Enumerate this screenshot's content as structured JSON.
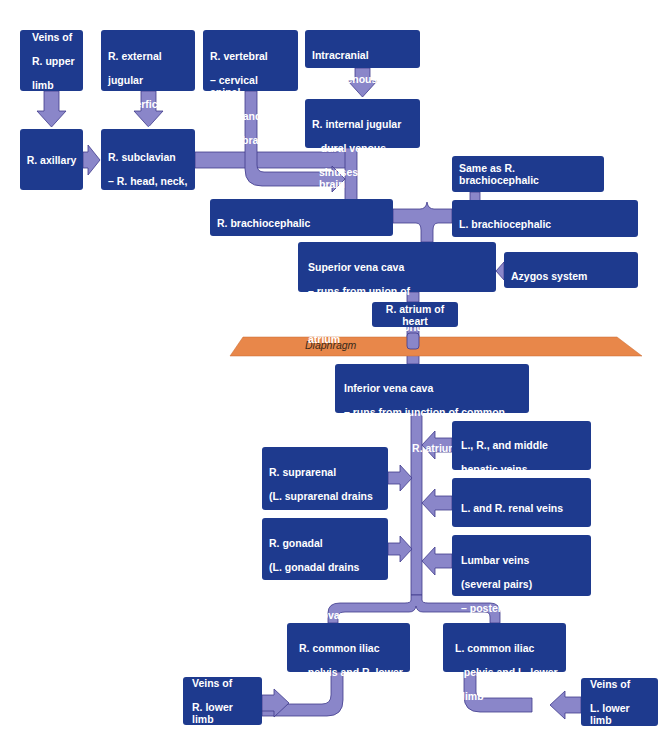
{
  "diagram": {
    "type": "flowchart",
    "colors": {
      "box_fill": "#1e3a8e",
      "box_text": "#ffffff",
      "connector_fill": "#8a86c9",
      "connector_stroke": "#3f3a8c",
      "diaphragm_fill": "#e8874a",
      "background": "#ffffff"
    },
    "nodes": {
      "veins_r_upper_limb": {
        "lines": [
          "Veins of",
          "R. upper",
          "limb"
        ]
      },
      "r_external_jugular": {
        "lines": [
          "R. external",
          "jugular"
        ],
        "sub": [
          "– superficial",
          "head and neck"
        ]
      },
      "r_vertebral": {
        "lines": [
          "R. vertebral"
        ],
        "sub": [
          "– cervical spinal",
          "cord and",
          "vertebrae"
        ]
      },
      "intracranial": {
        "lines": [
          "Intracranial",
          "dural venous sinuses"
        ]
      },
      "r_internal_jugular": {
        "lines": [
          "R. internal jugular"
        ],
        "sub": [
          "– dural venous",
          "sinuses of the brain"
        ]
      },
      "r_axillary": {
        "lines": [
          "R. axillary"
        ]
      },
      "r_subclavian": {
        "lines": [
          "R. subclavian"
        ],
        "sub": [
          "– R. head, neck,",
          "and upper",
          "limb"
        ]
      },
      "same_as_r_brachio": {
        "lines": [
          "Same as R. brachiocephalic"
        ]
      },
      "r_brachiocephalic": {
        "lines": [
          "R. brachiocephalic",
          "– R. side of head and R. upper limb"
        ]
      },
      "l_brachiocephalic": {
        "lines": [
          "L. brachiocephalic",
          "– L. side of head and L. upper limb"
        ]
      },
      "superior_vena_cava": {
        "lines": [
          "Superior vena cava",
          "– runs from union of brachiocephalic",
          "veins behind manubrium to R. atrium"
        ]
      },
      "azygos": {
        "lines": [
          "Azygos system",
          "– drains much of thorax"
        ]
      },
      "r_atrium": {
        "lines": [
          "R. atrium of heart"
        ]
      },
      "diaphragm": {
        "label": "Diaphragm"
      },
      "inferior_vena_cava": {
        "line1": "Inferior vena cava",
        "line2": "– runs from junction of common iliac",
        "line3_pre": "veins at L",
        "line3_sub": "5",
        "line3_post": " to R. atrium of heart"
      },
      "hepatic": {
        "lines": [
          "L., R., and middle",
          "hepatic veins",
          "– liver"
        ]
      },
      "r_suprarenal": {
        "lines": [
          "R. suprarenal",
          "(L. suprarenal drains",
          "into L. renal vein)",
          "– adrenal glands"
        ]
      },
      "renal": {
        "lines": [
          "L. and R. renal veins",
          "– kidneys"
        ]
      },
      "r_gonadal": {
        "lines": [
          "R. gonadal",
          "(L. gonadal drains",
          "into L. renal vein)",
          "– testis or ovary"
        ]
      },
      "lumbar": {
        "lines": [
          "Lumbar veins",
          "(several pairs)",
          "– posterior abdominal"
        ],
        "sub": [
          "wall"
        ]
      },
      "r_common_iliac": {
        "lines": [
          "R. common iliac"
        ],
        "sub": [
          "– pelvis and R. lower",
          "limb"
        ]
      },
      "l_common_iliac": {
        "lines": [
          "L. common iliac"
        ],
        "sub": [
          "– pelvis and L. lower",
          "limb"
        ]
      },
      "veins_r_lower_limb": {
        "lines": [
          "Veins of",
          "R. lower limb"
        ]
      },
      "veins_l_lower_limb": {
        "lines": [
          "Veins of",
          "L. lower limb"
        ]
      }
    },
    "edges": [
      [
        "veins_r_upper_limb",
        "r_axillary"
      ],
      [
        "r_axillary",
        "r_subclavian"
      ],
      [
        "r_external_jugular",
        "r_subclavian"
      ],
      [
        "r_subclavian",
        "r_brachiocephalic"
      ],
      [
        "r_vertebral",
        "r_brachiocephalic"
      ],
      [
        "intracranial",
        "r_internal_jugular"
      ],
      [
        "r_internal_jugular",
        "r_brachiocephalic"
      ],
      [
        "same_as_r_brachio",
        "l_brachiocephalic"
      ],
      [
        "r_brachiocephalic",
        "superior_vena_cava"
      ],
      [
        "l_brachiocephalic",
        "superior_vena_cava"
      ],
      [
        "azygos",
        "superior_vena_cava"
      ],
      [
        "superior_vena_cava",
        "r_atrium"
      ],
      [
        "inferior_vena_cava",
        "r_atrium"
      ],
      [
        "hepatic",
        "inferior_vena_cava"
      ],
      [
        "r_suprarenal",
        "inferior_vena_cava"
      ],
      [
        "renal",
        "inferior_vena_cava"
      ],
      [
        "r_gonadal",
        "inferior_vena_cava"
      ],
      [
        "lumbar",
        "inferior_vena_cava"
      ],
      [
        "r_common_iliac",
        "inferior_vena_cava"
      ],
      [
        "l_common_iliac",
        "inferior_vena_cava"
      ],
      [
        "veins_r_lower_limb",
        "r_common_iliac"
      ],
      [
        "veins_l_lower_limb",
        "l_common_iliac"
      ]
    ]
  }
}
